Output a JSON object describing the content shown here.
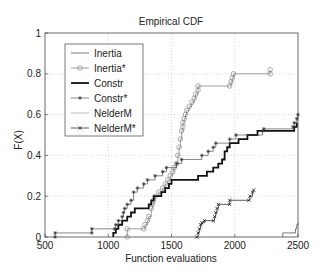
{
  "chart_data": {
    "type": "line",
    "title": "Empirical CDF",
    "xlabel": "Function evaluations",
    "ylabel": "F(X)",
    "xlim": [
      500,
      2500
    ],
    "ylim": [
      0,
      1
    ],
    "xticks": [
      500,
      1000,
      1500,
      2000,
      2500
    ],
    "yticks": [
      0,
      0.2,
      0.4,
      0.6,
      0.8,
      1
    ],
    "ytick_labels": [
      "0",
      "0.2",
      "0.4",
      "0.6",
      "0.8",
      "1"
    ],
    "grid": true,
    "legend_position": "upper left",
    "series": [
      {
        "name": "Inertia",
        "style": "thin-line",
        "points": [
          [
            2380,
            0
          ],
          [
            2380,
            0.02
          ],
          [
            2480,
            0.02
          ],
          [
            2480,
            0.04
          ],
          [
            2490,
            0.06
          ],
          [
            2500,
            0.07
          ]
        ]
      },
      {
        "name": "Inertia*",
        "style": "circle-marker",
        "points": [
          [
            1150,
            0
          ],
          [
            1150,
            0.04
          ],
          [
            1280,
            0.04
          ],
          [
            1290,
            0.06
          ],
          [
            1310,
            0.08
          ],
          [
            1320,
            0.1
          ],
          [
            1340,
            0.14
          ],
          [
            1350,
            0.16
          ],
          [
            1360,
            0.18
          ],
          [
            1370,
            0.2
          ],
          [
            1400,
            0.22
          ],
          [
            1430,
            0.24
          ],
          [
            1450,
            0.26
          ],
          [
            1470,
            0.28
          ],
          [
            1490,
            0.3
          ],
          [
            1510,
            0.32
          ],
          [
            1520,
            0.34
          ],
          [
            1540,
            0.36
          ],
          [
            1550,
            0.4
          ],
          [
            1560,
            0.44
          ],
          [
            1570,
            0.48
          ],
          [
            1580,
            0.52
          ],
          [
            1590,
            0.54
          ],
          [
            1590,
            0.56
          ],
          [
            1600,
            0.58
          ],
          [
            1610,
            0.6
          ],
          [
            1620,
            0.62
          ],
          [
            1640,
            0.64
          ],
          [
            1660,
            0.66
          ],
          [
            1680,
            0.68
          ],
          [
            1690,
            0.7
          ],
          [
            1710,
            0.72
          ],
          [
            1710,
            0.74
          ],
          [
            1960,
            0.74
          ],
          [
            1970,
            0.76
          ],
          [
            1980,
            0.78
          ],
          [
            1990,
            0.8
          ],
          [
            2280,
            0.8
          ],
          [
            2280,
            0.82
          ]
        ]
      },
      {
        "name": "Constr",
        "style": "thick-line",
        "points": [
          [
            1040,
            0
          ],
          [
            1040,
            0.02
          ],
          [
            1060,
            0.04
          ],
          [
            1080,
            0.06
          ],
          [
            1110,
            0.08
          ],
          [
            1150,
            0.1
          ],
          [
            1180,
            0.12
          ],
          [
            1210,
            0.14
          ],
          [
            1320,
            0.16
          ],
          [
            1340,
            0.18
          ],
          [
            1360,
            0.2
          ],
          [
            1420,
            0.22
          ],
          [
            1450,
            0.24
          ],
          [
            1480,
            0.26
          ],
          [
            1500,
            0.28
          ],
          [
            1710,
            0.3
          ],
          [
            1780,
            0.32
          ],
          [
            1830,
            0.34
          ],
          [
            1870,
            0.36
          ],
          [
            1900,
            0.38
          ],
          [
            1920,
            0.42
          ],
          [
            1940,
            0.44
          ],
          [
            1960,
            0.46
          ],
          [
            2030,
            0.48
          ],
          [
            2100,
            0.5
          ],
          [
            2180,
            0.52
          ],
          [
            2470,
            0.54
          ],
          [
            2490,
            0.56
          ]
        ]
      },
      {
        "name": "Constr*",
        "style": "star-marker",
        "points": [
          [
            580,
            0
          ],
          [
            580,
            0.02
          ],
          [
            870,
            0.02
          ],
          [
            870,
            0.04
          ],
          [
            1050,
            0.04
          ],
          [
            1060,
            0.06
          ],
          [
            1080,
            0.08
          ],
          [
            1110,
            0.1
          ],
          [
            1120,
            0.12
          ],
          [
            1130,
            0.14
          ],
          [
            1150,
            0.16
          ],
          [
            1180,
            0.18
          ],
          [
            1200,
            0.22
          ],
          [
            1230,
            0.24
          ],
          [
            1280,
            0.26
          ],
          [
            1310,
            0.28
          ],
          [
            1370,
            0.3
          ],
          [
            1430,
            0.32
          ],
          [
            1460,
            0.34
          ],
          [
            1540,
            0.36
          ],
          [
            1580,
            0.38
          ],
          [
            1740,
            0.4
          ],
          [
            1790,
            0.42
          ],
          [
            1830,
            0.44
          ],
          [
            1850,
            0.46
          ],
          [
            1960,
            0.48
          ],
          [
            2010,
            0.5
          ],
          [
            2220,
            0.52
          ],
          [
            2230,
            0.53
          ],
          [
            2460,
            0.54
          ],
          [
            2470,
            0.56
          ],
          [
            2490,
            0.58
          ],
          [
            2500,
            0.6
          ]
        ]
      },
      {
        "name": "NelderM",
        "style": "thin-light-line",
        "points": []
      },
      {
        "name": "NelderM*",
        "style": "x-marker",
        "points": [
          [
            1700,
            0
          ],
          [
            1710,
            0.02
          ],
          [
            1720,
            0.04
          ],
          [
            1730,
            0.06
          ],
          [
            1740,
            0.07
          ],
          [
            1760,
            0.08
          ],
          [
            1830,
            0.08
          ],
          [
            1840,
            0.1
          ],
          [
            1850,
            0.12
          ],
          [
            1860,
            0.14
          ],
          [
            1870,
            0.16
          ],
          [
            1960,
            0.16
          ],
          [
            1960,
            0.18
          ],
          [
            2110,
            0.18
          ],
          [
            2120,
            0.2
          ],
          [
            2140,
            0.22
          ],
          [
            2150,
            0.23
          ]
        ]
      }
    ]
  }
}
